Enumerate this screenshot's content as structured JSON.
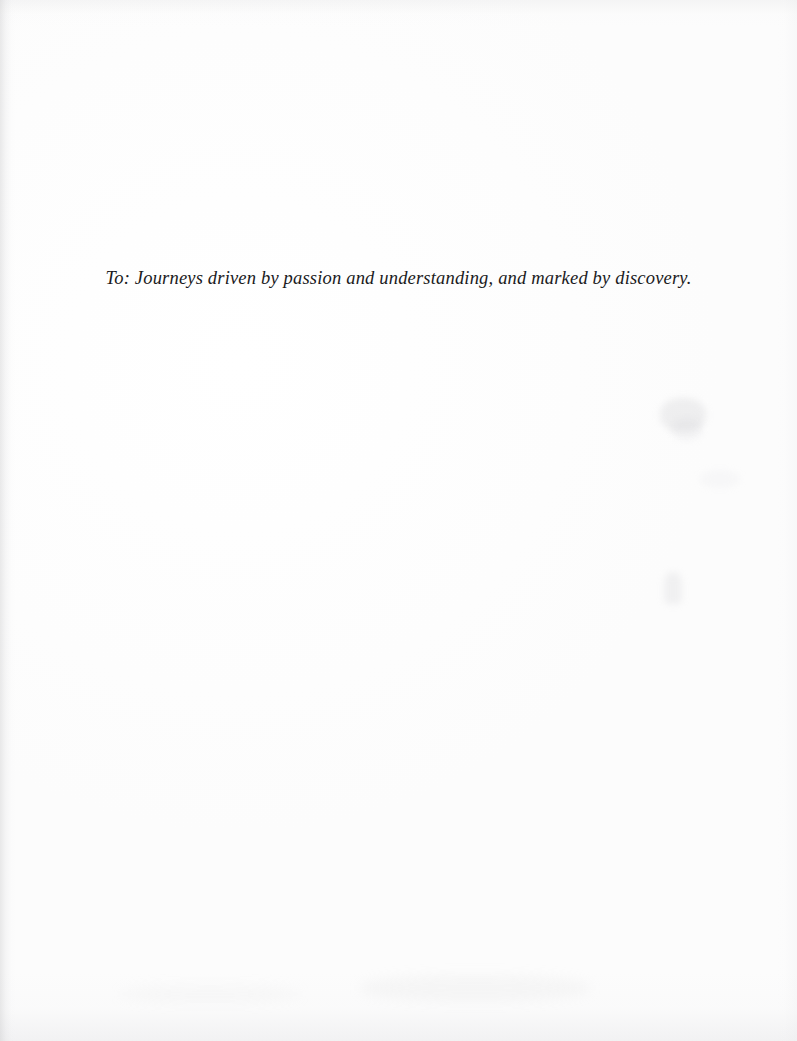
{
  "page": {
    "kind": "book-dedication-page",
    "width": 797,
    "height": 1041,
    "background_color": "#ffffff",
    "paper_tone": "#fdfdfd"
  },
  "dedication": {
    "text": "To: Journeys driven by passion and understanding, and marked by discovery.",
    "text_color": "#1b1b1d",
    "style": "italic-serif",
    "alignment": "center"
  },
  "artifacts": {
    "gutter_shadow_color": "#b4b4b6",
    "edge_tone_color": "#e2e2e4",
    "bleed_through_color": "#c6c6ca"
  }
}
